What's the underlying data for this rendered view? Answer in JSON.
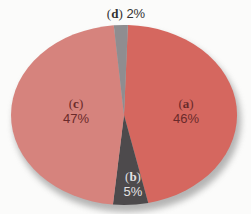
{
  "chart_data": {
    "type": "pie",
    "title": "",
    "slices": [
      {
        "key": "a",
        "label": "(a)",
        "value": 46,
        "display": "46%",
        "color": "#d5675f",
        "text_color": "#6a2a2a"
      },
      {
        "key": "b",
        "label": "(b)",
        "value": 5,
        "display": "5%",
        "color": "#4d4a4c",
        "text_color": "#e3e1e3"
      },
      {
        "key": "c",
        "label": "(c)",
        "value": 47,
        "display": "47%",
        "color": "#d6837d",
        "text_color": "#6a2a2a"
      },
      {
        "key": "d",
        "label": "(d)",
        "value": 2,
        "display": "2%",
        "color": "#8f8d90",
        "text_color": "#333333"
      }
    ],
    "legend": "none",
    "labels_inside": true
  },
  "labels": {
    "a": {
      "key": "a",
      "pct": "46%"
    },
    "b": {
      "key": "b",
      "pct": "5%"
    },
    "c": {
      "key": "c",
      "pct": "47%"
    },
    "d": {
      "key": "d",
      "pct": "2%"
    }
  }
}
